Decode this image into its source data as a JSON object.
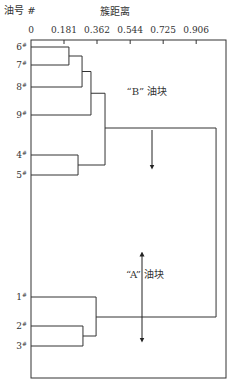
{
  "chart_data": {
    "type": "dendrogram",
    "title": "",
    "ylabel": "油号 #",
    "xlabel": "簇距离",
    "x_ticks": [
      "0",
      "0.181",
      "0.362",
      "0.544",
      "0.725",
      "0.906"
    ],
    "x_tick_values": [
      0,
      0.181,
      0.362,
      0.544,
      0.725,
      0.906
    ],
    "xlim": [
      0,
      1.07
    ],
    "leaves": [
      "6#",
      "7#",
      "8#",
      "9#",
      "4#",
      "5#",
      "1#",
      "2#",
      "3#"
    ],
    "merges": [
      {
        "id": "m67",
        "children": [
          "6#",
          "7#"
        ],
        "distance": 0.208
      },
      {
        "id": "m678",
        "children": [
          "m67",
          "8#"
        ],
        "distance": 0.28
      },
      {
        "id": "m6789",
        "children": [
          "m678",
          "9#"
        ],
        "distance": 0.329
      },
      {
        "id": "m45",
        "children": [
          "4#",
          "5#"
        ],
        "distance": 0.258
      },
      {
        "id": "mB",
        "children": [
          "m6789",
          "m45"
        ],
        "distance": 0.406
      },
      {
        "id": "m23",
        "children": [
          "2#",
          "3#"
        ],
        "distance": 0.285
      },
      {
        "id": "mA",
        "children": [
          "1#",
          "m23"
        ],
        "distance": 0.357
      },
      {
        "id": "root",
        "children": [
          "mB",
          "mA"
        ],
        "distance": 1.015
      }
    ],
    "annotations": [
      {
        "text": "“B” 油块",
        "group": "B",
        "arrow": "down"
      },
      {
        "text": "“A” 油块",
        "group": "A",
        "arrow": "both"
      }
    ],
    "grid": false
  }
}
